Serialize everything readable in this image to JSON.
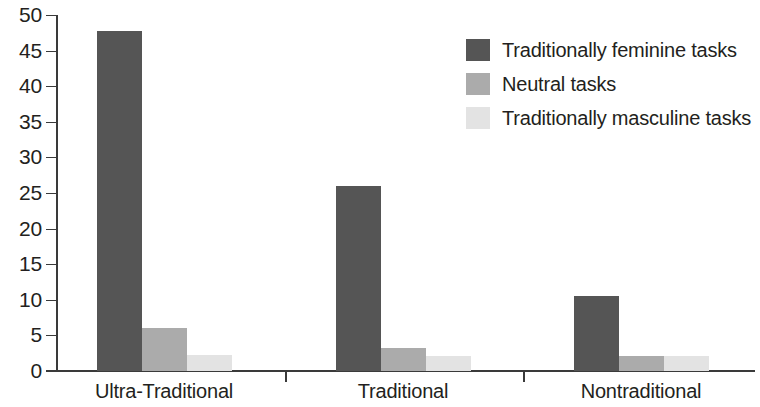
{
  "chart_data": {
    "type": "bar",
    "title": "",
    "subtitle": "",
    "xlabel": "",
    "ylabel": "",
    "categories": [
      "Ultra-Traditional",
      "Traditional",
      "Nontraditional"
    ],
    "series": [
      {
        "name": "Traditionally feminine tasks",
        "color": "#555555",
        "values": [
          47.7,
          26.0,
          10.5
        ]
      },
      {
        "name": "Neutral tasks",
        "color": "#ababab",
        "values": [
          6.0,
          3.2,
          2.1
        ]
      },
      {
        "name": "Traditionally masculine tasks",
        "color": "#e3e3e3",
        "values": [
          2.2,
          2.1,
          2.1
        ]
      }
    ],
    "ylim": [
      0,
      50
    ],
    "yticks": [
      0,
      5,
      10,
      15,
      20,
      25,
      30,
      35,
      40,
      45,
      50
    ],
    "ytick_labels": [
      "0",
      "5",
      "10",
      "15",
      "20",
      "25",
      "30",
      "35",
      "40",
      "45",
      "50"
    ],
    "grid": false,
    "legend_position": "top-right",
    "annotations": []
  },
  "axis": {
    "y_labels": [
      "50",
      "45",
      "40",
      "35",
      "30",
      "25",
      "20",
      "15",
      "10",
      "5",
      "0"
    ],
    "x_labels": [
      "Ultra-Traditional",
      "Traditional",
      "Nontraditional"
    ]
  },
  "legend": {
    "entries": [
      {
        "label": "Traditionally feminine tasks",
        "color": "#555555"
      },
      {
        "label": "Neutral tasks",
        "color": "#ababab"
      },
      {
        "label": "Traditionally masculine tasks",
        "color": "#e3e3e3"
      }
    ]
  }
}
